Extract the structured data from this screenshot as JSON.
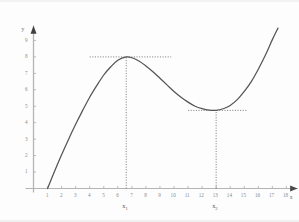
{
  "chart_data": {
    "type": "line",
    "title": "",
    "xlabel": "x",
    "ylabel": "y",
    "xlim": [
      0,
      18.8
    ],
    "ylim": [
      0,
      9.9
    ],
    "grid": false,
    "legend": null,
    "x_ticks": [
      1,
      2,
      3,
      4,
      5,
      6,
      7,
      8,
      9,
      10,
      11,
      12,
      13,
      14,
      15,
      16,
      17,
      18
    ],
    "y_ticks": [
      1,
      2,
      3,
      4,
      5,
      6,
      7,
      8,
      9
    ],
    "series": [
      {
        "name": "curve",
        "color": "#555555",
        "x": [
          1.0,
          1.5,
          2.0,
          2.5,
          3.0,
          3.5,
          4.0,
          4.5,
          5.0,
          5.5,
          6.0,
          6.6,
          7.0,
          7.5,
          8.0,
          8.5,
          9.0,
          9.5,
          10.0,
          10.5,
          11.0,
          11.5,
          12.0,
          12.5,
          13.0,
          13.5,
          14.0,
          14.5,
          15.0,
          15.5,
          16.0,
          16.5,
          17.0,
          17.4
        ],
        "y": [
          0.0,
          1.05,
          2.05,
          3.0,
          3.9,
          4.75,
          5.55,
          6.25,
          6.9,
          7.4,
          7.8,
          8.0,
          7.95,
          7.75,
          7.45,
          7.1,
          6.7,
          6.3,
          5.9,
          5.55,
          5.25,
          5.0,
          4.85,
          4.76,
          4.75,
          4.85,
          5.05,
          5.4,
          5.9,
          6.5,
          7.25,
          8.1,
          9.05,
          9.75
        ]
      }
    ],
    "annotations": {
      "maximum": {
        "label": "x",
        "sub": "1",
        "x": 6.6,
        "y": 8,
        "guide_h_from": 4.0,
        "guide_h_to": 9.8,
        "guide_v_from": 0,
        "guide_v_to": 8
      },
      "minimum": {
        "label": "x",
        "sub": "2",
        "x": 13.0,
        "y": 4.75,
        "guide_h_from": 11.0,
        "guide_h_to": 15.2,
        "guide_v_from": 0,
        "guide_v_to": 4.75
      }
    },
    "style": {
      "axis_color": "#b4b4b4",
      "curve_color": "#555555",
      "guide_color": "#666666",
      "tick_label_color": "#8a8a8a",
      "background": "#fdfdfd"
    }
  }
}
